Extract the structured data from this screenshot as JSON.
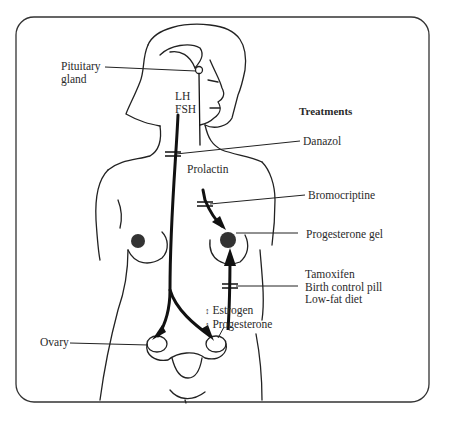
{
  "diagram": {
    "type": "anatomical hormone pathway illustration",
    "frame": {
      "shape": "rounded-rectangle",
      "stroke": "#333333",
      "background": "#ffffff"
    },
    "labels": {
      "pituitary": [
        "Pituitary",
        "gland"
      ],
      "lh": "LH",
      "fsh": "FSH",
      "prolactin": "Prolactin",
      "ovary": "Ovary",
      "estrogen": "Estrogen",
      "progesterone": "Progesterone",
      "estrogen_arrow": "↕",
      "progesterone_arrow": "↕"
    },
    "treatments": {
      "title": "Treatments",
      "items": [
        {
          "label": "Danazol",
          "target": "LH/FSH pathway"
        },
        {
          "label": "Bromocriptine",
          "target": "Prolactin pathway"
        },
        {
          "label": "Progesterone gel",
          "target": "Breast"
        },
        {
          "lines": [
            "Tamoxifen",
            "Birth control pill",
            "Low-fat diet"
          ],
          "target": "Estrogen/Progesterone pathway"
        }
      ]
    },
    "pathways": [
      {
        "from": "Pituitary gland",
        "to": "Ovary",
        "hormones": "LH, FSH"
      },
      {
        "from": "Pituitary gland",
        "to": "Breast",
        "hormones": "Prolactin"
      },
      {
        "from": "Ovary",
        "to": "Breast",
        "hormones": "Estrogen, Progesterone"
      }
    ],
    "colors": {
      "ink": "#222222",
      "line": "#333333"
    }
  }
}
